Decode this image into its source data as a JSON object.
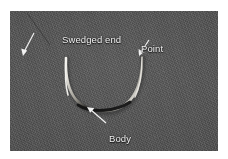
{
  "figure": {
    "background_color": "#ffffff",
    "photo": {
      "background_color": "#4b4b4b",
      "left": 10,
      "top": 11,
      "width": 208,
      "height": 140
    },
    "needle": {
      "shape": "U-shaped arc",
      "highlight_color": "#e6e4df",
      "shadow_color": "#1b1b1b",
      "mid_color": "#b9b6ae"
    },
    "annotation_color": "#f2f2f2"
  },
  "annotations": [
    {
      "id": "swedged-end",
      "label": "Swedged end",
      "leader": {
        "x1": 24,
        "y1": 22,
        "x2": 13,
        "y2": 42
      }
    },
    {
      "id": "point",
      "label": "Point",
      "leader": {
        "x1": 138,
        "y1": 29,
        "x2": 129,
        "y2": 43
      }
    },
    {
      "id": "body",
      "label": "Body",
      "leader": {
        "x1": 95,
        "y1": 112,
        "x2": 78,
        "y2": 97
      }
    }
  ]
}
